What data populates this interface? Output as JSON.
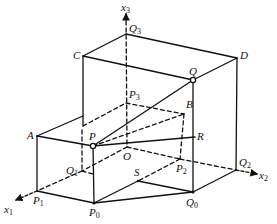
{
  "axes": [
    {
      "name": "x",
      "sub": "1",
      "x": 12,
      "y": 202
    },
    {
      "name": "x",
      "sub": "2",
      "x": 259,
      "y": 170
    },
    {
      "name": "x",
      "sub": "3",
      "x": 121,
      "y": 2
    }
  ],
  "points": [
    {
      "name": "Q",
      "sub": "3",
      "x": 129,
      "y": 24
    },
    {
      "name": "C",
      "sub": "",
      "x": 72,
      "y": 50
    },
    {
      "name": "D",
      "sub": "",
      "x": 240,
      "y": 50
    },
    {
      "name": "Q",
      "sub": "",
      "x": 190,
      "y": 66
    },
    {
      "name": "P",
      "sub": "3",
      "x": 129,
      "y": 88
    },
    {
      "name": "B",
      "sub": "",
      "x": 186,
      "y": 99
    },
    {
      "name": "A",
      "sub": "",
      "x": 27,
      "y": 130
    },
    {
      "name": "P",
      "sub": "",
      "x": 89,
      "y": 131
    },
    {
      "name": "R",
      "sub": "",
      "x": 196,
      "y": 132
    },
    {
      "name": "O",
      "sub": "",
      "x": 124,
      "y": 150
    },
    {
      "name": "Q",
      "sub": "1",
      "x": 64,
      "y": 164
    },
    {
      "name": "S",
      "sub": "",
      "x": 134,
      "y": 167
    },
    {
      "name": "P",
      "sub": "2",
      "x": 176,
      "y": 163
    },
    {
      "name": "Q",
      "sub": "2",
      "x": 238,
      "y": 157
    },
    {
      "name": "P",
      "sub": "1",
      "x": 33,
      "y": 196
    },
    {
      "name": "P",
      "sub": "0",
      "x": 89,
      "y": 207
    },
    {
      "name": "Q",
      "sub": "0",
      "x": 185,
      "y": 196
    }
  ]
}
